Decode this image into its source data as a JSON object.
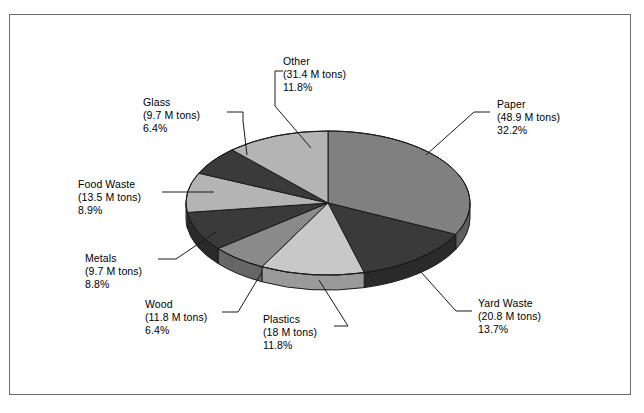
{
  "chart_data": {
    "type": "pie",
    "title": "",
    "subtitle": "",
    "xlabel": "",
    "ylabel": "",
    "units": "M tons",
    "legend_position": "none",
    "grid": false,
    "three_d": true,
    "categories": [
      "Paper",
      "Yard Waste",
      "Plastics",
      "Wood",
      "Metals",
      "Food Waste",
      "Glass",
      "Other"
    ],
    "values": [
      48.9,
      20.8,
      18,
      11.8,
      9.7,
      13.5,
      9.7,
      31.4
    ],
    "percents": [
      32.2,
      13.7,
      11.8,
      6.4,
      8.8,
      8.9,
      6.4,
      11.8
    ],
    "slices": [
      {
        "name": "Paper",
        "value": 48.9,
        "value_text": "(48.9 M tons)",
        "percent": 32.2,
        "percent_text": "32.2%",
        "color": "#808080",
        "side_color": "#5e5e5e"
      },
      {
        "name": "Yard Waste",
        "value": 20.8,
        "value_text": "(20.8 M tons)",
        "percent": 13.7,
        "percent_text": "13.7%",
        "color": "#3a3a3a",
        "side_color": "#2a2a2a"
      },
      {
        "name": "Plastics",
        "value": 18.0,
        "value_text": "(18 M tons)",
        "percent": 11.8,
        "percent_text": "11.8%",
        "color": "#c8c8c8",
        "side_color": "#9a9a9a"
      },
      {
        "name": "Wood",
        "value": 11.8,
        "value_text": "(11.8 M tons)",
        "percent": 6.4,
        "percent_text": "6.4%",
        "color": "#8a8a8a",
        "side_color": "#666666"
      },
      {
        "name": "Metals",
        "value": 9.7,
        "value_text": "(9.7 M tons)",
        "percent": 8.8,
        "percent_text": "8.8%",
        "color": "#3a3a3a",
        "side_color": "#2a2a2a"
      },
      {
        "name": "Food Waste",
        "value": 13.5,
        "value_text": "(13.5 M tons)",
        "percent": 8.9,
        "percent_text": "8.9%",
        "color": "#b4b4b4",
        "side_color": "#8c8c8c"
      },
      {
        "name": "Glass",
        "value": 9.7,
        "value_text": "(9.7 M tons)",
        "percent": 6.4,
        "percent_text": "6.4%",
        "color": "#3a3a3a",
        "side_color": "#2a2a2a"
      },
      {
        "name": "Other",
        "value": 31.4,
        "value_text": "(31.4 M tons)",
        "percent": 11.8,
        "percent_text": "11.8%",
        "color": "#b4b4b4",
        "side_color": "#8c8c8c"
      }
    ]
  },
  "labels": {
    "other": {
      "name": "Other",
      "value_text": "(31.4 M tons)",
      "percent_text": "11.8%"
    },
    "glass": {
      "name": "Glass",
      "value_text": "(9.7 M tons)",
      "percent_text": "6.4%"
    },
    "food_waste": {
      "name": "Food Waste",
      "value_text": "(13.5 M tons)",
      "percent_text": "8.9%"
    },
    "metals": {
      "name": "Metals",
      "value_text": "(9.7 M tons)",
      "percent_text": "8.8%"
    },
    "wood": {
      "name": "Wood",
      "value_text": "(11.8 M tons)",
      "percent_text": "6.4%"
    },
    "plastics": {
      "name": "Plastics",
      "value_text": "(18 M tons)",
      "percent_text": "11.8%"
    },
    "yard_waste": {
      "name": "Yard Waste",
      "value_text": "(20.8 M tons)",
      "percent_text": "13.7%"
    },
    "paper": {
      "name": "Paper",
      "value_text": "(48.9 M tons)",
      "percent_text": "32.2%"
    }
  },
  "colors": {
    "frame_border": "#6b6b6b",
    "background": "#ffffff",
    "outline": "#1a1a1a",
    "text": "#000000"
  }
}
